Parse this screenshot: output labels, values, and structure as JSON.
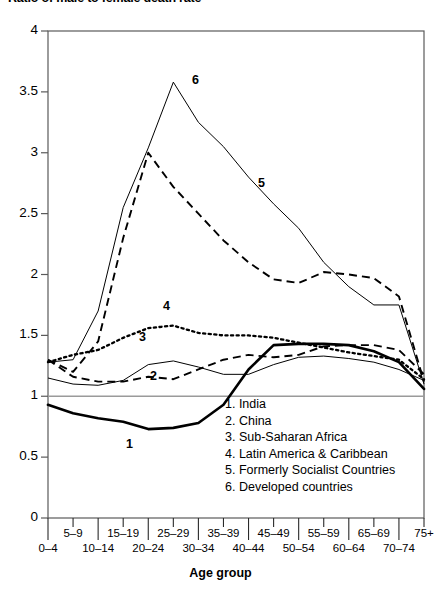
{
  "chart_title": "Ratio of male to female death rate",
  "axes": {
    "x_title": "Age group",
    "y_ticks": [
      "0",
      "0.5",
      "1",
      "1.5",
      "2",
      "2.5",
      "3",
      "3.5",
      "4"
    ],
    "x_ticks": [
      "0–4",
      "5–9",
      "10–14",
      "15–19",
      "20–24",
      "25–29",
      "30–34",
      "35–39",
      "40–44",
      "45–49",
      "50–54",
      "55–59",
      "60–64",
      "65–69",
      "70–74",
      "75+"
    ]
  },
  "legend": {
    "items": [
      "1. India",
      "2. China",
      "3. Sub-Saharan Africa",
      "4. Latin America & Caribbean",
      "5. Formerly Socialist Countries",
      "6. Developed countries"
    ]
  },
  "curve_labels": {
    "one": "1",
    "two": "2",
    "three": "3",
    "four": "4",
    "five": "5",
    "six": "6"
  },
  "chart_data": {
    "type": "line",
    "title": "Ratio of male to female death rate",
    "xlabel": "Age group",
    "ylabel": "",
    "ylim": [
      0,
      4
    ],
    "grid": false,
    "legend_position": "inside-center-right",
    "reference_line_y": 1,
    "categories": [
      "0–4",
      "5–9",
      "10–14",
      "15–19",
      "20–24",
      "25–29",
      "30–34",
      "35–39",
      "40–44",
      "45–49",
      "50–54",
      "55–59",
      "60–64",
      "65–69",
      "70–74",
      "75+"
    ],
    "series": [
      {
        "name": "India",
        "label": "1",
        "style": "thick-solid",
        "values": [
          0.93,
          0.86,
          0.82,
          0.79,
          0.73,
          0.74,
          0.78,
          0.93,
          1.22,
          1.42,
          1.43,
          1.43,
          1.42,
          1.37,
          1.28,
          1.06
        ]
      },
      {
        "name": "China",
        "label": "2",
        "style": "dashed",
        "values": [
          1.3,
          1.16,
          1.12,
          1.12,
          1.16,
          1.14,
          1.22,
          1.3,
          1.34,
          1.32,
          1.34,
          1.41,
          1.42,
          1.42,
          1.38,
          1.18
        ]
      },
      {
        "name": "Sub-Saharan Africa",
        "label": "3",
        "style": "thin-solid",
        "values": [
          1.15,
          1.1,
          1.09,
          1.13,
          1.26,
          1.29,
          1.24,
          1.18,
          1.18,
          1.26,
          1.32,
          1.33,
          1.31,
          1.28,
          1.22,
          1.13
        ]
      },
      {
        "name": "Latin America & Caribbean",
        "label": "4",
        "style": "dotted",
        "values": [
          1.28,
          1.34,
          1.38,
          1.48,
          1.56,
          1.58,
          1.52,
          1.5,
          1.5,
          1.48,
          1.44,
          1.4,
          1.36,
          1.33,
          1.3,
          1.14
        ]
      },
      {
        "name": "Formerly Socialist Countries",
        "label": "5",
        "style": "dashed",
        "values": [
          1.3,
          1.2,
          1.45,
          2.3,
          3.0,
          2.72,
          2.5,
          2.28,
          2.1,
          1.96,
          1.93,
          2.02,
          2.0,
          1.97,
          1.82,
          1.12
        ]
      },
      {
        "name": "Developed countries",
        "label": "6",
        "style": "thin-solid",
        "values": [
          1.28,
          1.3,
          1.7,
          2.55,
          3.04,
          3.58,
          3.25,
          3.05,
          2.8,
          2.58,
          2.38,
          2.1,
          1.9,
          1.75,
          1.75,
          1.1
        ]
      }
    ]
  }
}
